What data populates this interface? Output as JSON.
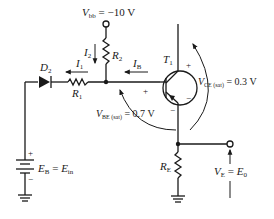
{
  "diagram": {
    "type": "transistor-switch-schematic",
    "labels": {
      "vbb_sym": "V",
      "vbb_sub": "bb",
      "vbb_value": " = −10 V",
      "r2": "R",
      "r2_sub": "2",
      "r1": "R",
      "r1_sub": "1",
      "re": "R",
      "re_sub": "E",
      "d2": "D",
      "d2_sub": "2",
      "t1": "T",
      "t1_sub": "1",
      "i1": "I",
      "i1_sub": "1",
      "i2": "I",
      "i2_sub": "2",
      "ib": "I",
      "ib_sub": "B",
      "vce_sym": "V",
      "vce_sub": "CE (sat)",
      "vce_value": " = 0.3 V",
      "vbe_sym": "V",
      "vbe_sub": "BE (sat)",
      "vbe_value": " = 0.7 V",
      "eb_sym": "E",
      "eb_sub": "B",
      "eb_eq": " = ",
      "ein_sym": "E",
      "ein_sub": "in",
      "ve_sym": "V",
      "ve_sub": "E",
      "ve_eq": " = ",
      "e0_sym": "E",
      "e0_sub": "0",
      "plus": "+",
      "minus": "−"
    },
    "components": [
      {
        "id": "Vbb",
        "kind": "supply-terminal",
        "value": "-10 V"
      },
      {
        "id": "R2",
        "kind": "resistor"
      },
      {
        "id": "R1",
        "kind": "resistor"
      },
      {
        "id": "D2",
        "kind": "diode"
      },
      {
        "id": "T1",
        "kind": "pnp-transistor"
      },
      {
        "id": "RE",
        "kind": "resistor"
      },
      {
        "id": "EB",
        "kind": "battery",
        "label": "EB = Ein"
      },
      {
        "id": "VE",
        "kind": "output-terminal",
        "label": "VE = E0"
      }
    ],
    "annotations": [
      {
        "id": "VCE_sat",
        "value": "0.3 V"
      },
      {
        "id": "VBE_sat",
        "value": "0.7 V"
      }
    ]
  }
}
